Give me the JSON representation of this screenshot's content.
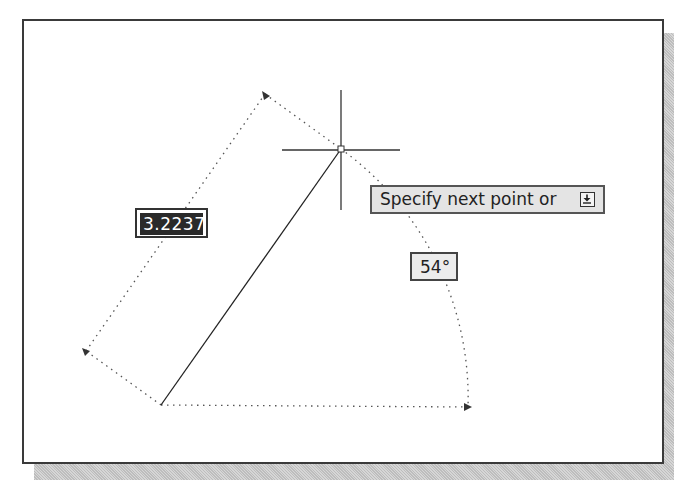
{
  "drawing": {
    "length_value": "3.2237",
    "angle_value": "54°",
    "prompt_text": "Specify next point or",
    "prompt_icon": "down-arrow-options-icon"
  },
  "colors": {
    "frame": "#3a3a3a",
    "line": "#222222",
    "dotted": "#555555",
    "tooltip_bg": "#e4e4e4",
    "length_bg": "#2a2a2a"
  }
}
